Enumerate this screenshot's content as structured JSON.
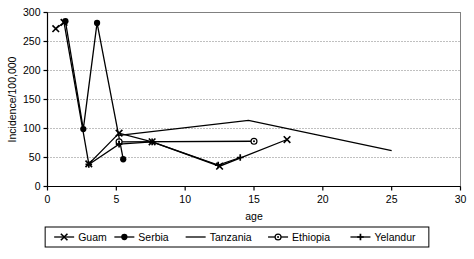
{
  "chart_data": {
    "type": "line",
    "title": "",
    "xlabel": "age",
    "ylabel": "Incidence/100,000",
    "xlim": [
      0,
      30
    ],
    "ylim": [
      0,
      300
    ],
    "xticks": [
      0,
      5,
      10,
      15,
      20,
      25,
      30
    ],
    "yticks": [
      0,
      50,
      100,
      150,
      200,
      250,
      300
    ],
    "grid": "horizontal-dotted",
    "legend_position": "bottom",
    "series": [
      {
        "name": "Guam",
        "marker": "x",
        "points": [
          {
            "x": 0.6,
            "y": 272
          },
          {
            "x": 1.2,
            "y": 283
          },
          {
            "x": 3.0,
            "y": 39
          },
          {
            "x": 5.2,
            "y": 92
          },
          {
            "x": 7.6,
            "y": 77
          },
          {
            "x": 12.5,
            "y": 35
          },
          {
            "x": 17.4,
            "y": 81
          }
        ]
      },
      {
        "name": "Serbia",
        "marker": "filled-circle",
        "points": [
          {
            "x": 1.3,
            "y": 285
          },
          {
            "x": 2.6,
            "y": 99
          },
          {
            "x": 3.6,
            "y": 282
          },
          {
            "x": 5.5,
            "y": 47
          }
        ]
      },
      {
        "name": "Tanzania",
        "marker": "none",
        "points": [
          {
            "x": 5.2,
            "y": 88
          },
          {
            "x": 14.6,
            "y": 114
          },
          {
            "x": 25.0,
            "y": 62
          }
        ]
      },
      {
        "name": "Ethiopia",
        "marker": "open-circle",
        "points": [
          {
            "x": 5.2,
            "y": 77
          },
          {
            "x": 15.0,
            "y": 78
          }
        ]
      },
      {
        "name": "Yelandur",
        "marker": "plus",
        "points": [
          {
            "x": 3.0,
            "y": 38
          },
          {
            "x": 5.2,
            "y": 73
          },
          {
            "x": 7.6,
            "y": 77
          },
          {
            "x": 12.4,
            "y": 37
          },
          {
            "x": 14.0,
            "y": 50
          }
        ]
      }
    ]
  },
  "legend": {
    "entries": [
      {
        "label": "Guam",
        "marker": "x"
      },
      {
        "label": "Serbia",
        "marker": "filled-circle"
      },
      {
        "label": "Tanzania",
        "marker": "none"
      },
      {
        "label": "Ethiopia",
        "marker": "open-circle"
      },
      {
        "label": "Yelandur",
        "marker": "plus"
      }
    ]
  },
  "colors": {
    "line": "#000000",
    "grid": "#808080",
    "frame": "#808080",
    "background": "#ffffff"
  }
}
